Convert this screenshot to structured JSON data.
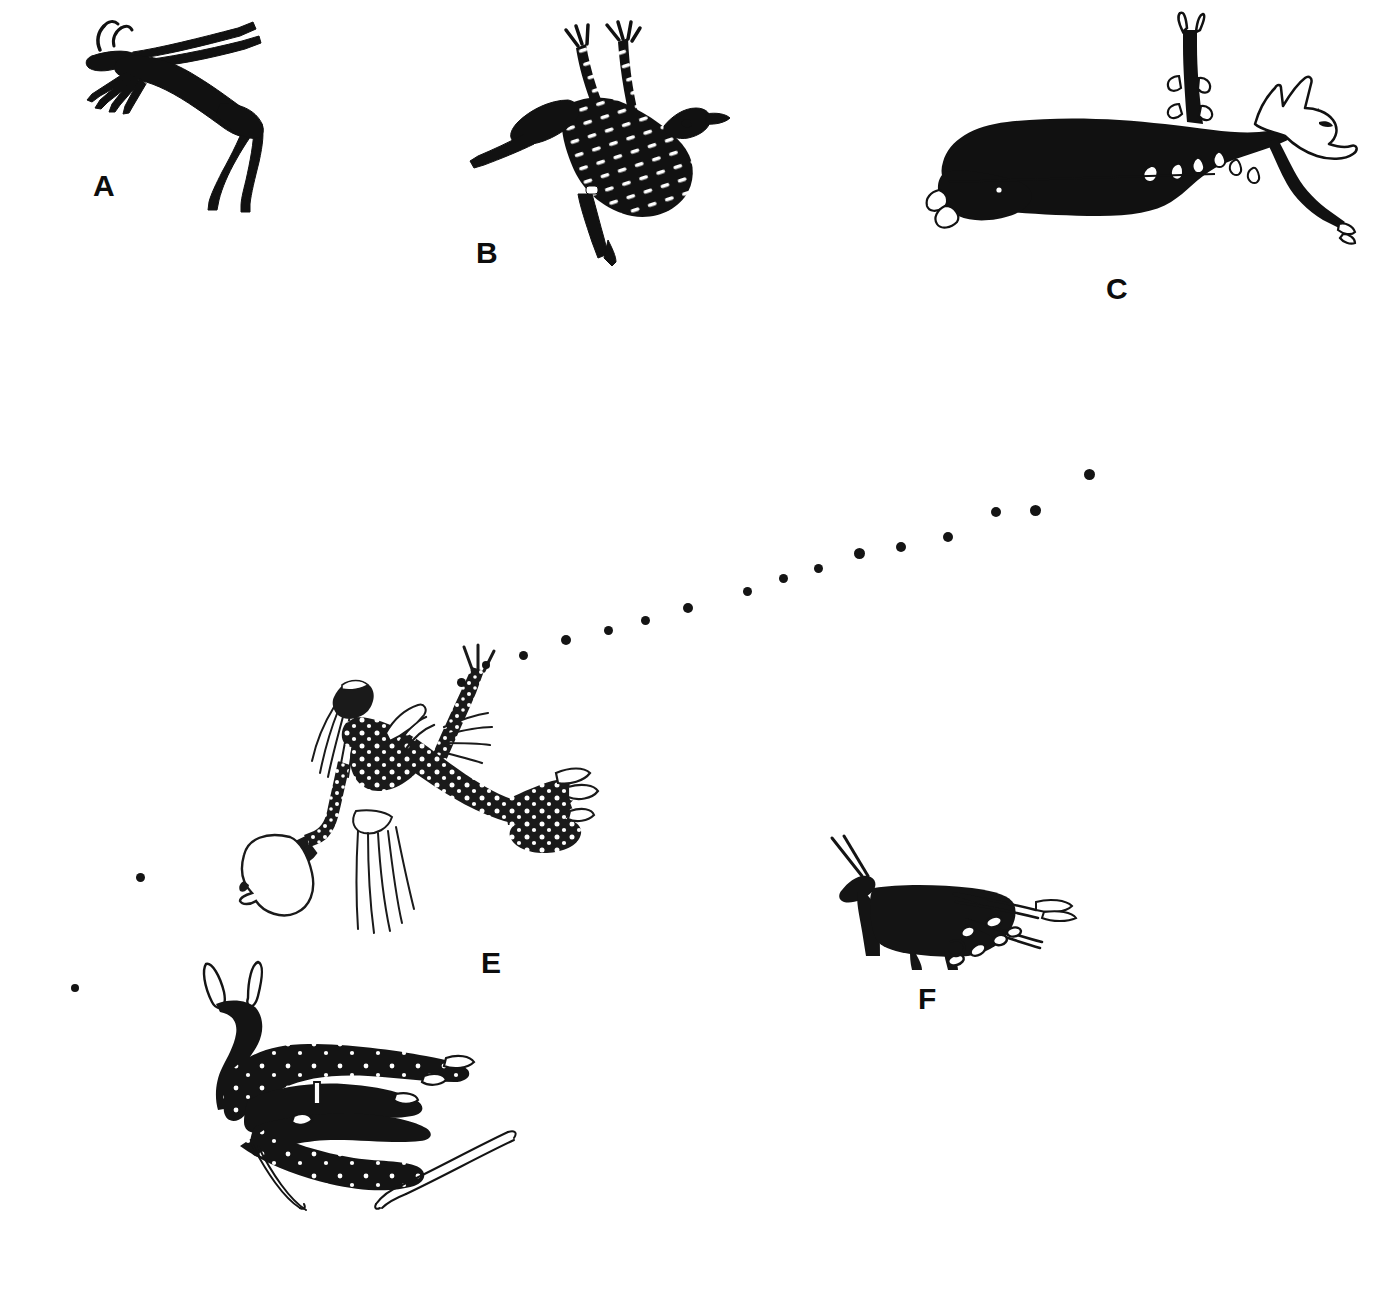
{
  "plate": {
    "title": "Rock art figure plate",
    "width": 1395,
    "height": 1308,
    "background_color": "#ffffff",
    "ink_color": "#111111",
    "description": "Six line-drawn tracings of prehistoric rock paintings: antelope, ostrich, canid, therianthropic and human figures, with a dotted trajectory line."
  },
  "labels": [
    {
      "id": "A",
      "text": "A",
      "x": 93,
      "y": 171
    },
    {
      "id": "B",
      "text": "B",
      "x": 476,
      "y": 238
    },
    {
      "id": "C",
      "text": "C",
      "x": 1106,
      "y": 274
    },
    {
      "id": "E",
      "text": "E",
      "x": 481,
      "y": 948
    },
    {
      "id": "F",
      "text": "F",
      "x": 918,
      "y": 984
    }
  ],
  "figures": [
    {
      "id": "A",
      "label": "A",
      "name": "leaping-antelope-figure",
      "subject": "antelope with long swept-back horns and splayed forelegs",
      "fill": "solid-black",
      "x": 70,
      "y": 10,
      "width": 240,
      "height": 200
    },
    {
      "id": "B",
      "label": "B",
      "name": "ostrich-figure",
      "subject": "ostrich-like bird with raised legs and white dash body texture",
      "fill": "black-with-white-dashes",
      "x": 470,
      "y": 10,
      "width": 260,
      "height": 250
    },
    {
      "id": "C",
      "label": "C",
      "name": "canid-figure",
      "subject": "large reclining canid with white outlined muzzle, ears and hooves",
      "fill": "solid-black-with-white-outline-details",
      "x": 920,
      "y": 15,
      "width": 450,
      "height": 255
    },
    {
      "id": "D",
      "label": "",
      "name": "recumbent-eland-figure",
      "subject": "recumbent eland-like animal with white outlined ears and long curved lines",
      "fill": "black-with-white-dots",
      "x": 180,
      "y": 955,
      "width": 370,
      "height": 250
    },
    {
      "id": "E",
      "label": "E",
      "name": "dancing-human-figure",
      "subject": "human figure with beaded dotted body, fringed apron, raised arm, holding white gourd bag",
      "fill": "black-with-white-dots",
      "x": 240,
      "y": 630,
      "width": 360,
      "height": 320
    },
    {
      "id": "F",
      "label": "F",
      "name": "small-antelope-figure",
      "subject": "small antelope with straight horns, trailing lines and oval droppings",
      "fill": "solid-black",
      "x": 820,
      "y": 835,
      "width": 270,
      "height": 135
    }
  ],
  "trajectory": {
    "name": "dotted-flight-line",
    "description": "line of graded dots rising from the raised arm of figure E toward the upper right",
    "dot_color": "#141414",
    "points": [
      {
        "x": 75,
        "y": 988,
        "r": 4.0
      },
      {
        "x": 140,
        "y": 877,
        "r": 4.5
      },
      {
        "x": 461,
        "y": 682,
        "r": 4.5
      },
      {
        "x": 486,
        "y": 665,
        "r": 4.0
      },
      {
        "x": 523,
        "y": 655,
        "r": 4.5
      },
      {
        "x": 566,
        "y": 640,
        "r": 5.0
      },
      {
        "x": 608,
        "y": 630,
        "r": 4.5
      },
      {
        "x": 645,
        "y": 620,
        "r": 4.5
      },
      {
        "x": 688,
        "y": 608,
        "r": 5.0
      },
      {
        "x": 747,
        "y": 591,
        "r": 4.5
      },
      {
        "x": 783,
        "y": 578,
        "r": 4.5
      },
      {
        "x": 818,
        "y": 568,
        "r": 4.5
      },
      {
        "x": 859,
        "y": 553,
        "r": 5.5
      },
      {
        "x": 901,
        "y": 547,
        "r": 5.0
      },
      {
        "x": 948,
        "y": 537,
        "r": 5.0
      },
      {
        "x": 996,
        "y": 512,
        "r": 5.0
      },
      {
        "x": 1035,
        "y": 510,
        "r": 5.5
      },
      {
        "x": 1089,
        "y": 474,
        "r": 5.5
      }
    ]
  }
}
